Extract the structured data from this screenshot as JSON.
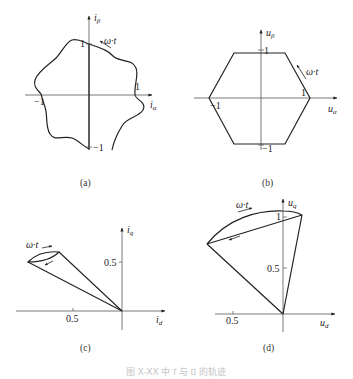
{
  "figure": {
    "caption": "图 X-XX  中 i⃗ 与 u⃗ 的轨迹",
    "line_color": "#222222",
    "axis_color": "#555555"
  },
  "panels": [
    {
      "id": "a",
      "label": "(a)",
      "x_axis": {
        "symbol": "i",
        "subscript": "α"
      },
      "y_axis": {
        "symbol": "i",
        "subscript": "β"
      },
      "ticks": {
        "x_pos": "1",
        "x_neg": "−1",
        "y_pos": "1",
        "y_neg": "−1"
      },
      "rotation_label": "ω·t",
      "shape": "irregular closed curve (current space-vector trajectory with harmonics)"
    },
    {
      "id": "b",
      "label": "(b)",
      "x_axis": {
        "symbol": "u",
        "subscript": "α"
      },
      "y_axis": {
        "symbol": "u",
        "subscript": "β"
      },
      "ticks": {
        "x_pos": "1",
        "x_neg": "−1",
        "y_pos": "1",
        "y_neg": "−1"
      },
      "rotation_label": "ω·t",
      "shape": "hexagon (voltage space-vector trajectory)"
    },
    {
      "id": "c",
      "label": "(c)",
      "x_axis": {
        "symbol": "i",
        "subscript": "d"
      },
      "y_axis": {
        "symbol": "i",
        "subscript": "q"
      },
      "ticks": {
        "x": "0.5",
        "y": "0.5"
      },
      "rotation_label": "ω·t",
      "shape": "current vector sweeping a narrow lens-shaped region in d-q frame"
    },
    {
      "id": "d",
      "label": "(d)",
      "x_axis": {
        "symbol": "u",
        "subscript": "d"
      },
      "y_axis": {
        "symbol": "u",
        "subscript": "q"
      },
      "ticks": {
        "x": "0.5",
        "y_1": "1",
        "y_half": "0.5"
      },
      "rotation_label": "ω·t",
      "shape": "voltage vector sweeping a sector bounded by an arc in d-q frame"
    }
  ]
}
